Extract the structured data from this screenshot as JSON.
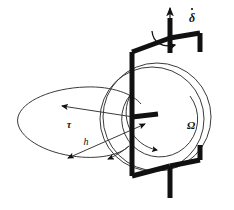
{
  "figure": {
    "kind": "gyroscope-schematic",
    "background_color": "#ffffff",
    "stroke_color": "#111111",
    "thin_stroke_color": "#3a3a3a",
    "width": 234,
    "height": 210
  },
  "labels": {
    "precession_rate": {
      "symbol": "δ",
      "name": "delta-dot",
      "has_overdot": true,
      "x": 192,
      "y": 18
    },
    "spin_rate": {
      "symbol": "Ω",
      "name": "omega",
      "has_overdot": false,
      "x": 191,
      "y": 126
    },
    "torque": {
      "symbol": "τ",
      "name": "tau",
      "has_overdot": false,
      "x": 69,
      "y": 126
    },
    "angular_momentum": {
      "symbol": "h",
      "name": "h",
      "has_overdot": false,
      "x": 86,
      "y": 143
    }
  },
  "components": {
    "vertical_shaft": "vertical-support-shaft",
    "top_arrow": "shaft-up-arrow",
    "precession_arc_arrow": "precession-curved-arrow",
    "gimbal_frame": "gimbal-frame",
    "axle_stub": "wheel-axle-stub",
    "wheel_outer": "gyro-wheel-outer-circle",
    "wheel_inner": "gyro-wheel-inner-circle",
    "spin_arc_arrow": "spin-curved-arrow",
    "precession_ellipse": "precession-ellipse",
    "torque_arrow": "torque-vector-arrow",
    "h_arrow": "angular-momentum-double-arrow",
    "ellipse_tip_arrow": "ellipse-direction-arrow"
  }
}
